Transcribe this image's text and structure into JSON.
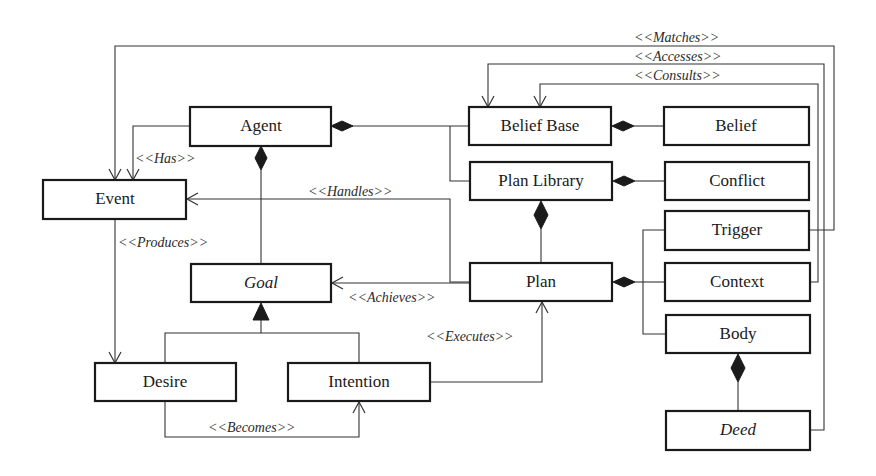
{
  "diagram": {
    "type": "uml-class-diagram",
    "classes": [
      {
        "id": "agent",
        "label": "Agent",
        "abstract": false
      },
      {
        "id": "event",
        "label": "Event",
        "abstract": false
      },
      {
        "id": "belief_base",
        "label": "Belief Base",
        "abstract": false
      },
      {
        "id": "belief",
        "label": "Belief",
        "abstract": false
      },
      {
        "id": "plan_library",
        "label": "Plan Library",
        "abstract": false
      },
      {
        "id": "conflict",
        "label": "Conflict",
        "abstract": false
      },
      {
        "id": "trigger",
        "label": "Trigger",
        "abstract": false
      },
      {
        "id": "plan",
        "label": "Plan",
        "abstract": false
      },
      {
        "id": "context",
        "label": "Context",
        "abstract": false
      },
      {
        "id": "goal",
        "label": "Goal",
        "abstract": true
      },
      {
        "id": "body",
        "label": "Body",
        "abstract": false
      },
      {
        "id": "desire",
        "label": "Desire",
        "abstract": false
      },
      {
        "id": "intention",
        "label": "Intention",
        "abstract": false
      },
      {
        "id": "deed",
        "label": "Deed",
        "abstract": true
      }
    ],
    "relations": [
      {
        "type": "association",
        "label": "<<Matches>>",
        "from": "trigger",
        "to": "event"
      },
      {
        "type": "association",
        "label": "<<Accesses>>",
        "from": "deed",
        "to": "belief_base"
      },
      {
        "type": "association",
        "label": "<<Consults>>",
        "from": "context",
        "to": "belief_base"
      },
      {
        "type": "association",
        "label": "<<Has>>",
        "from": "agent",
        "to": "event"
      },
      {
        "type": "association",
        "label": "<<Handles>>",
        "from": "plan",
        "to": "event"
      },
      {
        "type": "association",
        "label": "<<Produces>>",
        "from": "event",
        "to": "desire"
      },
      {
        "type": "association",
        "label": "<<Achieves>>",
        "from": "plan",
        "to": "goal"
      },
      {
        "type": "association",
        "label": "<<Executes>>",
        "from": "intention",
        "to": "plan"
      },
      {
        "type": "association",
        "label": "<<Becomes>>",
        "from": "desire",
        "to": "intention"
      },
      {
        "type": "composition",
        "label": "",
        "whole": "agent",
        "part": "belief_base"
      },
      {
        "type": "composition",
        "label": "",
        "whole": "agent",
        "part": "plan_library"
      },
      {
        "type": "composition",
        "label": "",
        "whole": "agent",
        "part": "goal"
      },
      {
        "type": "composition",
        "label": "",
        "whole": "belief_base",
        "part": "belief"
      },
      {
        "type": "composition",
        "label": "",
        "whole": "plan_library",
        "part": "conflict"
      },
      {
        "type": "composition",
        "label": "",
        "whole": "plan_library",
        "part": "plan"
      },
      {
        "type": "composition",
        "label": "",
        "whole": "plan",
        "part": "trigger"
      },
      {
        "type": "composition",
        "label": "",
        "whole": "plan",
        "part": "context"
      },
      {
        "type": "composition",
        "label": "",
        "whole": "plan",
        "part": "body"
      },
      {
        "type": "composition",
        "label": "",
        "whole": "body",
        "part": "deed"
      },
      {
        "type": "generalization",
        "label": "",
        "parent": "goal",
        "child": "desire"
      },
      {
        "type": "generalization",
        "label": "",
        "parent": "goal",
        "child": "intention"
      }
    ]
  },
  "labels": {
    "agent": "Agent",
    "event": "Event",
    "belief_base": "Belief Base",
    "belief": "Belief",
    "plan_library": "Plan Library",
    "conflict": "Conflict",
    "trigger": "Trigger",
    "plan": "Plan",
    "context": "Context",
    "goal": "Goal",
    "body": "Body",
    "desire": "Desire",
    "intention": "Intention",
    "deed": "Deed",
    "matches": "<<Matches>>",
    "accesses": "<<Accesses>>",
    "consults": "<<Consults>>",
    "has": "<<Has>>",
    "handles": "<<Handles>>",
    "produces": "<<Produces>>",
    "achieves": "<<Achieves>>",
    "executes": "<<Executes>>",
    "becomes": "<<Becomes>>"
  },
  "colors": {
    "background": "#ffffff",
    "stroke": "#1a1a1a",
    "connector": "#333333"
  }
}
